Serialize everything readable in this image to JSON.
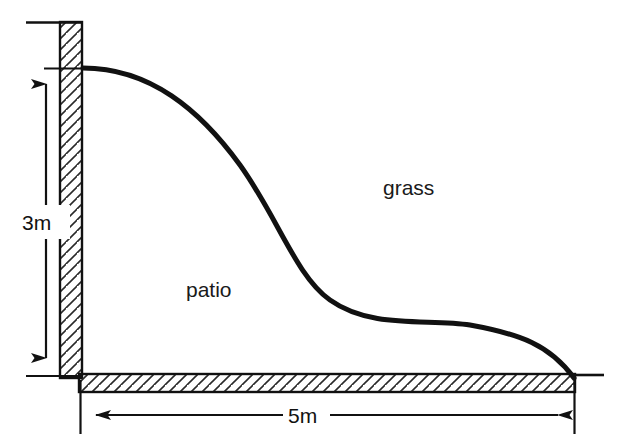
{
  "figure": {
    "background_color": "#ffffff",
    "line_color": "#111111",
    "hatch_color": "#2a2a2a"
  },
  "regions": [
    {
      "id": "patio",
      "label": "patio",
      "label_x": 216,
      "label_y": 290
    },
    {
      "id": "grass",
      "label": "grass",
      "label_x": 416,
      "label_y": 188
    }
  ],
  "dimensions": {
    "vertical": {
      "label": "3m",
      "value": 3,
      "unit": "m",
      "label_x": 42,
      "label_y": 222,
      "line_x": 46,
      "top_y": 68,
      "bottom_y": 374,
      "extension_top_x1": 44,
      "extension_top_x2": 82,
      "extension_bottom_x1": 26,
      "extension_bottom_x2": 82
    },
    "horizontal": {
      "label": "5m",
      "value": 5,
      "unit": "m",
      "label_x": 303,
      "label_y": 422,
      "line_y": 415,
      "left_x": 79,
      "right_x": 573,
      "gap_left": 272,
      "gap_right": 336
    }
  },
  "walls": {
    "vertical_wall": {
      "name": "left-wall",
      "x": 60,
      "y": 22,
      "width": 22,
      "height": 356,
      "cap_line_x1": 26,
      "cap_line_x2": 82,
      "cap_line_y": 22
    },
    "horizontal_wall": {
      "name": "bottom-wall",
      "x": 79,
      "y": 374,
      "width": 496,
      "height": 18,
      "cap_line_x1": 573,
      "cap_line_x2": 604,
      "cap_line_y": 374
    }
  },
  "boundary_curve": {
    "name": "patio-grass-boundary",
    "start": [
      83,
      68
    ],
    "end": [
      574,
      378
    ],
    "stroke_width": 5,
    "path": "M 83 68 C 150 68 200 110 240 165 C 278 218 296 276 330 300 C 372 330 430 318 470 325 C 520 334 550 345 574 378"
  }
}
